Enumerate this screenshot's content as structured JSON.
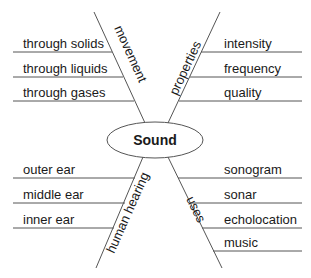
{
  "center": {
    "label": "Sound"
  },
  "branches": [
    {
      "name": "movement",
      "label": "movement",
      "position": "top-left",
      "details": [
        "through solids",
        "through liquids",
        "through gases"
      ]
    },
    {
      "name": "properties",
      "label": "properties",
      "position": "top-right",
      "details": [
        "intensity",
        "frequency",
        "quality"
      ]
    },
    {
      "name": "human-hearing",
      "label": "human hearing",
      "position": "bottom-left",
      "details": [
        "outer ear",
        "middle ear",
        "inner ear"
      ]
    },
    {
      "name": "uses",
      "label": "uses",
      "position": "bottom-right",
      "details": [
        "sonogram",
        "sonar",
        "echolocation",
        "music"
      ]
    }
  ]
}
